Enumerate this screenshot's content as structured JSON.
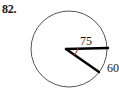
{
  "figure": {
    "problem_number": "82.",
    "canvas": {
      "width": 119,
      "height": 94
    },
    "colors": {
      "circle_stroke": "#555555",
      "sector_stroke": "#000000",
      "angle_arc": "#b03030",
      "label": "#1a1a1a",
      "background": "#ffffff"
    },
    "circle": {
      "center_x": 69,
      "center_y": 49,
      "radius": 38,
      "stroke_width": 1
    },
    "vertex": {
      "x": 66,
      "y": 49
    },
    "radius_line": {
      "label": "75",
      "from_x": 66,
      "from_y": 49,
      "to_x": 108,
      "to_y": 48,
      "stroke_width": 2.4
    },
    "chord_line": {
      "label": "60",
      "from_x": 66,
      "from_y": 49,
      "to_x": 99,
      "to_y": 72,
      "stroke_width": 2.4
    },
    "angle_arc": {
      "path": "M 78 48 A 12 12 0 0 1 74 55",
      "stroke_width": 1.1
    },
    "labels": {
      "radius_measure": "75",
      "arc_measure": "60",
      "radius_label_x": 86,
      "radius_label_y": 45,
      "arc_label_x": 107,
      "arc_label_y": 72
    }
  }
}
